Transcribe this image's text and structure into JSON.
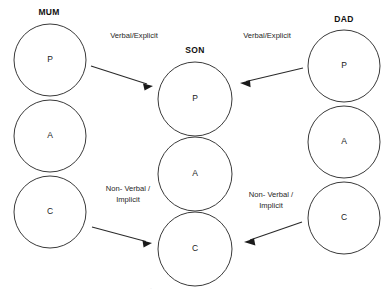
{
  "diagram": {
    "title_hidden": "Transactional Analysis Parent-Adult-Child communication diagram",
    "background_color": "#ffffff",
    "stroke_color": "#3a3a3a",
    "text_color": "#1a1a1a",
    "columns": [
      {
        "id": "mum",
        "label": "MUM",
        "label_x": 49,
        "label_y": 13,
        "cx": 50,
        "r": 36,
        "states": [
          {
            "letter": "P",
            "cy": 60
          },
          {
            "letter": "A",
            "cy": 136
          },
          {
            "letter": "C",
            "cy": 212
          }
        ]
      },
      {
        "id": "son",
        "label": "SON",
        "label_x": 195,
        "label_y": 51,
        "cx": 195,
        "r": 37,
        "states": [
          {
            "letter": "P",
            "cy": 99
          },
          {
            "letter": "A",
            "cy": 174
          },
          {
            "letter": "C",
            "cy": 249
          }
        ]
      },
      {
        "id": "dad",
        "label": "DAD",
        "label_x": 344,
        "label_y": 20,
        "cx": 344,
        "r": 36,
        "states": [
          {
            "letter": "P",
            "cy": 66
          },
          {
            "letter": "A",
            "cy": 142
          },
          {
            "letter": "C",
            "cy": 218
          }
        ]
      }
    ],
    "arrows": [
      {
        "id": "mum-parent-to-son-parent",
        "from": "MUM P",
        "to": "SON P",
        "x1": 91,
        "y1": 66,
        "x2": 153,
        "y2": 86
      },
      {
        "id": "dad-parent-to-son-parent",
        "from": "DAD P",
        "to": "SON P",
        "x1": 303,
        "y1": 68,
        "x2": 240,
        "y2": 83
      },
      {
        "id": "mum-child-to-son-child",
        "from": "MUM C",
        "to": "SON C",
        "x1": 92,
        "y1": 227,
        "x2": 152,
        "y2": 243
      },
      {
        "id": "dad-child-to-son-child",
        "from": "DAD C",
        "to": "SON C",
        "x1": 302,
        "y1": 222,
        "x2": 244,
        "y2": 242
      }
    ],
    "edge_labels": [
      {
        "id": "verbal-explicit-left",
        "x": 134,
        "y": 36,
        "lines": [
          "Verbal/Explicit"
        ]
      },
      {
        "id": "verbal-explicit-right",
        "x": 267,
        "y": 36,
        "lines": [
          "Verbal/Explicit"
        ]
      },
      {
        "id": "non-verbal-implicit-left",
        "x": 128,
        "y": 189,
        "lines": [
          "Non- Verbal /",
          "Implicit"
        ]
      },
      {
        "id": "non-verbal-implicit-right",
        "x": 271,
        "y": 195,
        "lines": [
          "Non- Verbal /",
          "Implicit"
        ]
      }
    ],
    "footer_artifact": "."
  }
}
